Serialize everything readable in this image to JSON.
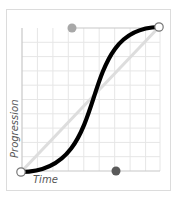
{
  "diagram": {
    "x_axis_label": "Time",
    "y_axis_label": "Progression",
    "grid": {
      "columns": 9,
      "rows": 10
    },
    "colors": {
      "curve": "#000000",
      "linear_reference": "#dddddd",
      "grid": "#e6e6e6",
      "axis": "#c8c8c8",
      "handle_start_control": "#5a5a5a",
      "handle_end_control": "#a8a8a8",
      "endpoint_fill": "#ffffff",
      "endpoint_stroke": "#777777"
    },
    "curve": {
      "type": "cubic-bezier",
      "start": [
        0,
        0
      ],
      "control1": [
        0.68,
        0
      ],
      "control2": [
        0.36,
        1
      ],
      "end": [
        1,
        1
      ]
    }
  }
}
